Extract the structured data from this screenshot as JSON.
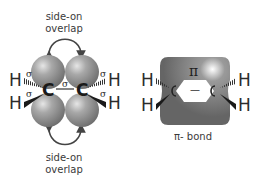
{
  "left_diagram": {
    "top_label": {
      "line1": "side-on",
      "line2": "overlap"
    },
    "bottom_label": {
      "line1": "side-on",
      "line2": "overlap"
    },
    "atoms": {
      "carbon_left": "C",
      "carbon_right": "C",
      "h_left_upper": "H",
      "h_left_lower": "H",
      "h_right_upper": "H",
      "h_right_lower": "H"
    },
    "sigma_labels": {
      "cc_bond": "σ",
      "left_upper": "σ",
      "left_lower": "σ",
      "right_upper": "σ",
      "right_lower": "σ"
    }
  },
  "right_diagram": {
    "pi_symbol": "π",
    "caption": "π- bond",
    "bond_dash": "—",
    "atoms": {
      "h_left_upper": "H",
      "h_left_lower": "H",
      "h_right_upper": "H",
      "h_right_lower": "H"
    }
  },
  "colors": {
    "sphere": "#8a8a8a",
    "sphere_highlight": "#d8d8d8",
    "pi_cloud": "#6e6e6e",
    "text": "#333333",
    "arrow": "#444444"
  }
}
